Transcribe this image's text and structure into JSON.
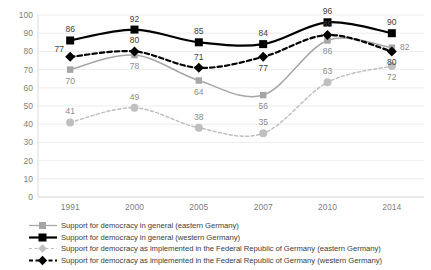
{
  "chart_data": {
    "type": "line",
    "title": "",
    "xlabel": "",
    "ylabel": "",
    "x": [
      "1991",
      "2000",
      "2005",
      "2007",
      "2010",
      "2014"
    ],
    "categories": [
      "1991",
      "2000",
      "2005",
      "2007",
      "2010",
      "2014"
    ],
    "ylim": [
      0,
      100
    ],
    "yticks": [
      0,
      10,
      20,
      30,
      40,
      50,
      60,
      70,
      80,
      90,
      100
    ],
    "ytick_labels": [
      "0",
      "10",
      "20",
      "30",
      "40",
      "50",
      "60",
      "70",
      "80",
      "90",
      "100"
    ],
    "grid": true,
    "legend_position": "bottom-left",
    "series": [
      {
        "name": "Support for democracy in general (eastern Germany)",
        "values": [
          70,
          78,
          64,
          56,
          86,
          82
        ],
        "color": "#a6a6a6",
        "marker": "square",
        "line_style": "solid",
        "label_offsets": [
          "below",
          "below",
          "below",
          "below",
          "below",
          "right"
        ]
      },
      {
        "name": "Support for democracy in general (western Germany)",
        "values": [
          86,
          92,
          85,
          84,
          96,
          90
        ],
        "color": "#000000",
        "marker": "square",
        "line_style": "solid",
        "label_offsets": [
          "above",
          "above",
          "above",
          "above",
          "above",
          "above"
        ]
      },
      {
        "name": "Support for democracy as implemented in the Federal Republic of Germany (eastern Germany)",
        "values": [
          41,
          49,
          38,
          35,
          63,
          72
        ],
        "color": "#bfbfbf",
        "marker": "diamond",
        "line_style": "dashed",
        "label_offsets": [
          "above",
          "above",
          "above",
          "above",
          "above",
          "below"
        ]
      },
      {
        "name": "Support for democracy as implemented in the Federal Republic of Germany (western Germany)",
        "values": [
          77,
          80,
          71,
          77,
          89,
          80
        ],
        "color": "#000000",
        "marker": "diamond",
        "line_style": "dashed",
        "label_offsets": [
          "left",
          "above",
          "above",
          "below",
          "above",
          "below"
        ]
      }
    ]
  },
  "legend": {
    "items": [
      {
        "label": "Support for democracy in general (eastern Germany)"
      },
      {
        "label": "Support for democracy in general (western Germany)"
      },
      {
        "label": "Support for democracy as implemented in the Federal Republic of Germany (eastern Germany)"
      },
      {
        "label": "Support for democracy as implemented in the Federal Republic of Germany (western Germany)"
      }
    ]
  },
  "colors": {
    "light_gray": "#a6a6a6",
    "lighter_gray": "#bfbfbf",
    "black": "#000000",
    "gridline": "#e8e8e8",
    "tick_text": "#7f7f7f"
  }
}
